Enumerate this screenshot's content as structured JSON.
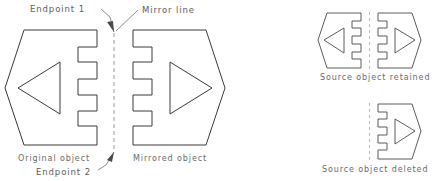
{
  "diagram": {
    "colors": {
      "outline": "#3a3a3a",
      "mirror_line": "#9a9a9a",
      "leader": "#6f6f6f",
      "text": "#5c5c5c",
      "background": "#ffffff"
    },
    "annotations": {
      "endpoint1": "Endpoint 1",
      "mirror_line": "Mirror line",
      "endpoint2": "Endpoint 2"
    },
    "captions": {
      "original": "Original object",
      "mirrored": "Mirrored object",
      "retained": "Source object retained",
      "deleted": "Source object deleted"
    }
  }
}
